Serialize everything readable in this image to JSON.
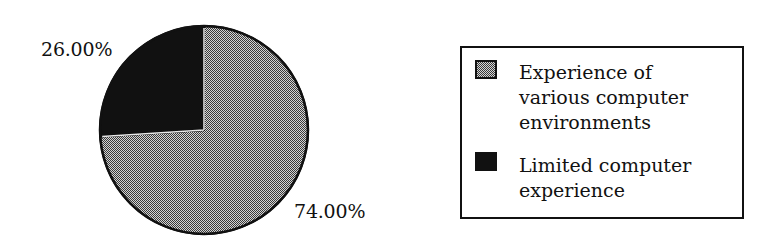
{
  "chart_data": {
    "type": "pie",
    "title": "",
    "slices": [
      {
        "label": "Experience of various computer environments",
        "value": 74.0,
        "display": "74.00%",
        "fill": "checker-grey"
      },
      {
        "label": "Limited computer experience",
        "value": 26.0,
        "display": "26.00%",
        "fill": "#111111"
      }
    ],
    "start_angle": "12 o'clock, dark slice counterclockwise",
    "legend_position": "right"
  },
  "labels": {
    "limited": "26.00%",
    "experienced": "74.00%"
  },
  "legend": {
    "items": [
      {
        "lines": [
          "Experience of",
          "various computer",
          "environments"
        ],
        "swatch": "checker-grey"
      },
      {
        "lines": [
          "Limited computer",
          "experience"
        ],
        "swatch": "#111111"
      }
    ]
  },
  "colors": {
    "dark": "#111111",
    "checker_light": "#d8d8d8",
    "checker_dark": "#3a3a3a"
  }
}
